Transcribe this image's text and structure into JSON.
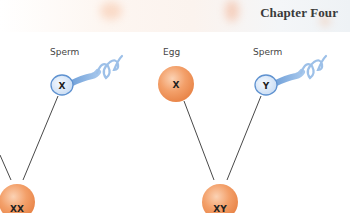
{
  "header": {
    "chapter_title": "Chapter Four"
  },
  "diagram": {
    "gametes": [
      {
        "type": "Sperm",
        "chromosome": "X"
      },
      {
        "type": "Egg",
        "chromosome": "X"
      },
      {
        "type": "Sperm",
        "chromosome": "Y"
      }
    ],
    "zygotes": [
      {
        "genotype": "XX"
      },
      {
        "genotype": "XY"
      }
    ],
    "colors": {
      "egg_fill": "#f19a5e",
      "egg_highlight": "#fbd2b4",
      "sperm_fill": "#dbe9f7",
      "sperm_stroke": "#6e9fd6",
      "sperm_tail": "#8db6e6",
      "line": "#333333"
    }
  }
}
